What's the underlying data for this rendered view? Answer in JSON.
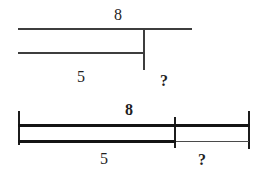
{
  "diagram": {
    "top_model": {
      "total_label": "8",
      "part_label": "5",
      "unknown_label": "?"
    },
    "bottom_model": {
      "total_label": "8",
      "part_label": "5",
      "unknown_label": "?"
    },
    "colors": {
      "top_line": "#3d3d3d",
      "bottom_bar": "#141414",
      "tick": "#1c1c1c",
      "background": "#ffffff",
      "text": "#1f1f1f"
    }
  }
}
